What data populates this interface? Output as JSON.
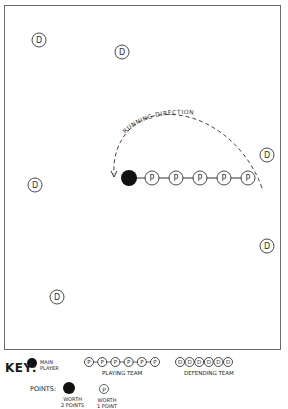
{
  "diagram": {
    "arc_label": "RUNNING DIRECTION",
    "main_player": {
      "x": 129,
      "y": 178,
      "r": 8,
      "color": "#111111"
    },
    "playing_team": [
      {
        "label": "P",
        "x": 152,
        "y": 178
      },
      {
        "label": "P",
        "x": 176,
        "y": 178
      },
      {
        "label": "P",
        "x": 200,
        "y": 178
      },
      {
        "label": "P",
        "x": 224,
        "y": 178
      },
      {
        "label": "P",
        "x": 248,
        "y": 178
      }
    ],
    "defending_team": [
      {
        "label": "D",
        "x": 39,
        "y": 40
      },
      {
        "label": "D",
        "x": 122,
        "y": 52
      },
      {
        "label": "D",
        "x": 267,
        "y": 155
      },
      {
        "label": "D",
        "x": 35,
        "y": 185
      },
      {
        "label": "D",
        "x": 267,
        "y": 246
      },
      {
        "label": "D",
        "x": 57,
        "y": 297
      }
    ]
  },
  "key": {
    "title": "KEY:",
    "main_player_label_1": "MAIN",
    "main_player_label_2": "PLAYER",
    "playing_team_label": "PLAYING TEAM",
    "playing_team_letter": "P",
    "defending_team_label": "DEFENDING TEAM",
    "defending_team_letter": "D",
    "points_label": "POINTS:",
    "worth_main_1": "WORTH",
    "worth_main_2": "2 POINTS",
    "worth_p_1": "WORTH",
    "worth_p_2": "1 POINT"
  }
}
